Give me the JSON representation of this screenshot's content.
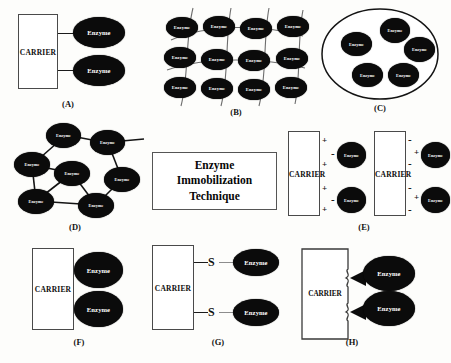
{
  "figure": {
    "center_title_line1": "Enzyme",
    "center_title_line2": "Immobilization",
    "center_title_line3": "Technique",
    "carrier_label": "CARRIER",
    "enzyme_label": "Enzyme",
    "sulfur_label": "S",
    "plus_sign": "+",
    "minus_sign": "-",
    "colors": {
      "background": "#fdfdfb",
      "enzyme_fill": "#0b0b0b",
      "enzyme_text": "#ffffff",
      "carrier_fill": "#ffffff",
      "carrier_stroke": "#4a4a4a",
      "line": "#1b1b1b",
      "text": "#111111"
    }
  },
  "panels": [
    {
      "id": "A",
      "label": "(A)",
      "name": "covalent-binding-to-carrier",
      "enzyme_count": 2
    },
    {
      "id": "B",
      "label": "(B)",
      "name": "entrapment-in-matrix",
      "enzyme_count": 12
    },
    {
      "id": "C",
      "label": "(C)",
      "name": "encapsulation-in-membrane",
      "enzyme_count": 5
    },
    {
      "id": "D",
      "label": "(D)",
      "name": "cross-linking-network",
      "enzyme_count": 7
    },
    {
      "id": "E",
      "label": "(E)",
      "name": "ionic-binding",
      "enzyme_count": 4
    },
    {
      "id": "F",
      "label": "(F)",
      "name": "physical-adsorption",
      "enzyme_count": 2
    },
    {
      "id": "G",
      "label": "(G)",
      "name": "disulfide-bond-binding",
      "enzyme_count": 2
    },
    {
      "id": "H",
      "label": "(H)",
      "name": "affinity-binding",
      "enzyme_count": 2
    }
  ],
  "panelB_enzymes": [
    "Enzyme",
    "Enzyme",
    "Enzyme",
    "Enzyme",
    "Enzyme",
    "Enzyme",
    "Enzyme",
    "Enzyme",
    "Enzyme",
    "Enzyme",
    "Enzyme",
    "Enzyme"
  ],
  "panelC_enzymes": [
    "Enzyme",
    "Enzyme",
    "Enzyme",
    "Enzyme",
    "Enzyme"
  ],
  "panelD_enzymes": [
    "Enzyme",
    "Enzyme",
    "Enzyme",
    "Enzyme",
    "Enzyme",
    "Enzyme",
    "Enzyme"
  ],
  "panelE": {
    "left_carrier_signs": [
      "+",
      "+",
      "+",
      "+"
    ],
    "left_enzyme_signs": [
      "-",
      "-"
    ],
    "right_carrier_signs": [
      "-",
      "-",
      "-",
      "-"
    ],
    "right_enzyme_signs": [
      "+",
      "+"
    ]
  }
}
